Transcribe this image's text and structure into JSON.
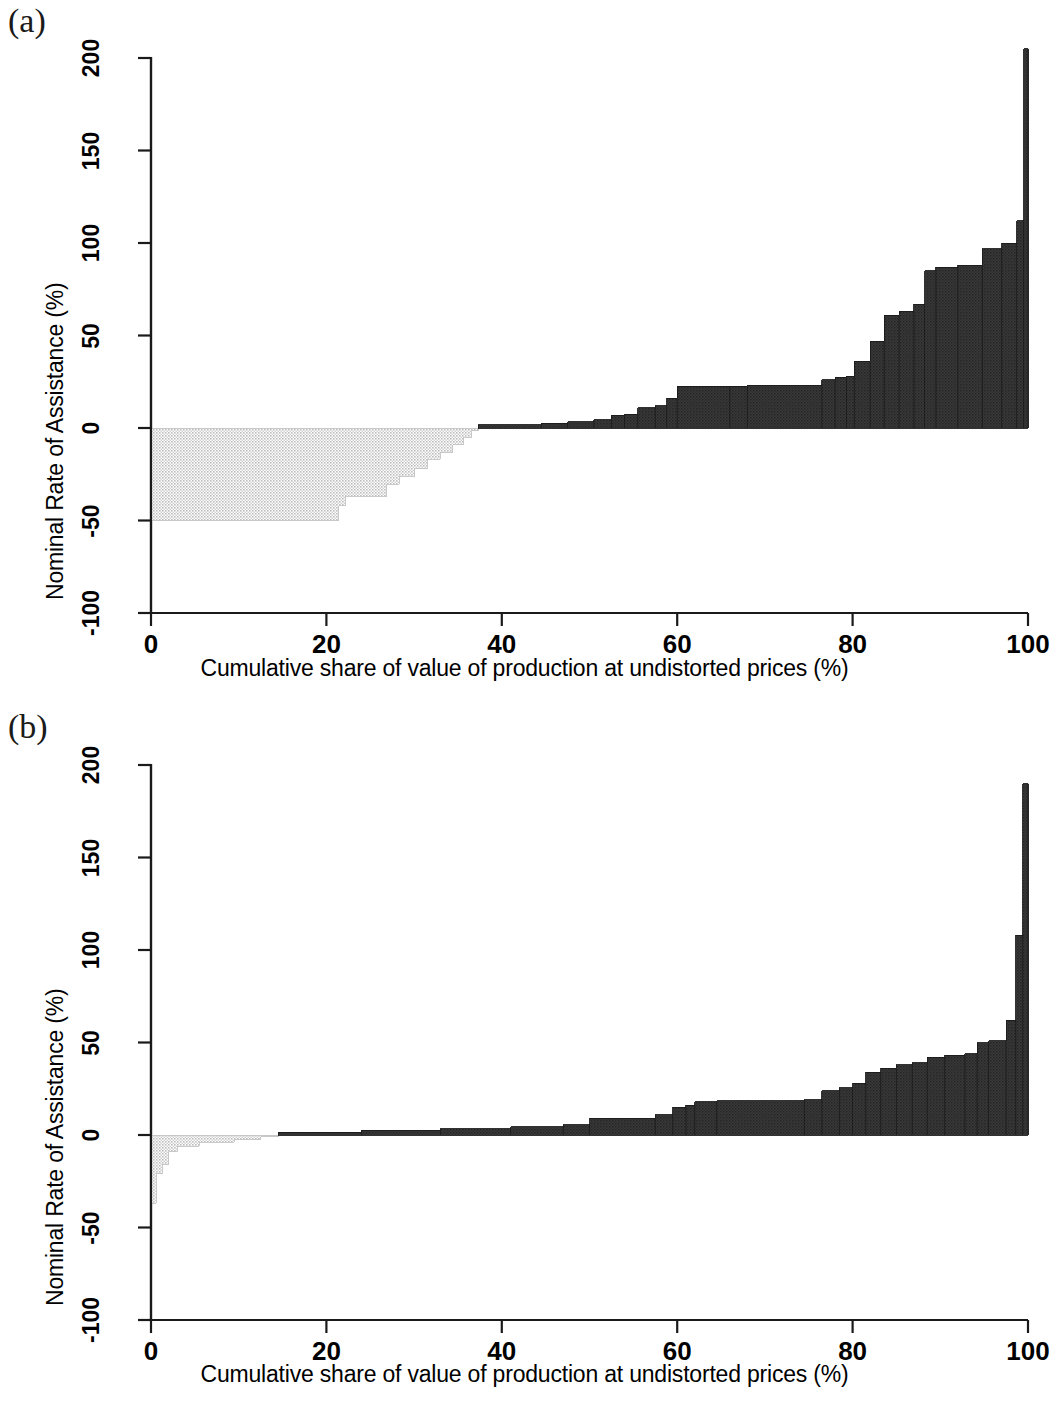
{
  "figure": {
    "background": "#ffffff",
    "panels": [
      {
        "label": "(a)",
        "name": "panel-a"
      },
      {
        "label": "(b)",
        "name": "panel-b"
      }
    ]
  },
  "axis_labels": {
    "y_title": "Nominal Rate of Assistance (%)",
    "x_title": "Cumulative share of value of production at undistorted prices (%)",
    "y_ticks": [
      "-100",
      "-50",
      "0",
      "50",
      "100",
      "150",
      "200"
    ],
    "x_ticks": [
      "0",
      "20",
      "40",
      "60",
      "80",
      "100"
    ]
  },
  "colors": {
    "negative_fill": "#d5d5d5",
    "positive_fill": "#333333",
    "outline": "#111111",
    "axis": "#1a1a1a"
  },
  "chart_data": [
    {
      "type": "area",
      "name": "panel-a",
      "title": "(a)",
      "xlabel": "Cumulative share of value of production at undistorted prices (%)",
      "ylabel": "Nominal Rate of Assistance (%)",
      "xlim": [
        0,
        100
      ],
      "ylim": [
        -100,
        200
      ],
      "yticks": [
        -100,
        -50,
        0,
        50,
        100,
        150,
        200
      ],
      "xticks": [
        0,
        20,
        40,
        60,
        80,
        100
      ],
      "grid": false,
      "legend": "none",
      "description": "Step/ staircase cumulative distribution of Nominal Rate of Assistance against cumulative share of value of production. Negative portion shaded light grey, positive portion shaded dark grey.",
      "steps": [
        {
          "x_start": 0.0,
          "x_end": 21.4,
          "value": -50.0
        },
        {
          "x_start": 21.4,
          "x_end": 22.2,
          "value": -42.0
        },
        {
          "x_start": 22.2,
          "x_end": 26.9,
          "value": -37.0
        },
        {
          "x_start": 26.9,
          "x_end": 28.3,
          "value": -30.5
        },
        {
          "x_start": 28.3,
          "x_end": 30.1,
          "value": -26.0
        },
        {
          "x_start": 30.1,
          "x_end": 31.5,
          "value": -22.0
        },
        {
          "x_start": 31.5,
          "x_end": 33.0,
          "value": -17.0
        },
        {
          "x_start": 33.0,
          "x_end": 34.4,
          "value": -13.0
        },
        {
          "x_start": 34.4,
          "x_end": 35.6,
          "value": -9.0
        },
        {
          "x_start": 35.6,
          "x_end": 36.6,
          "value": -5.0
        },
        {
          "x_start": 36.6,
          "x_end": 37.3,
          "value": -1.5
        },
        {
          "x_start": 37.3,
          "x_end": 44.5,
          "value": 1.8
        },
        {
          "x_start": 44.5,
          "x_end": 47.5,
          "value": 2.5
        },
        {
          "x_start": 47.5,
          "x_end": 50.5,
          "value": 3.5
        },
        {
          "x_start": 50.5,
          "x_end": 52.5,
          "value": 4.5
        },
        {
          "x_start": 52.5,
          "x_end": 54.0,
          "value": 7.0
        },
        {
          "x_start": 54.0,
          "x_end": 55.5,
          "value": 7.5
        },
        {
          "x_start": 55.5,
          "x_end": 57.5,
          "value": 11.0
        },
        {
          "x_start": 57.5,
          "x_end": 58.8,
          "value": 12.0
        },
        {
          "x_start": 58.8,
          "x_end": 60.0,
          "value": 16.0
        },
        {
          "x_start": 60.0,
          "x_end": 66.0,
          "value": 22.5
        },
        {
          "x_start": 66.0,
          "x_end": 68.0,
          "value": 22.5
        },
        {
          "x_start": 68.0,
          "x_end": 76.5,
          "value": 23.0
        },
        {
          "x_start": 76.5,
          "x_end": 78.0,
          "value": 26.0
        },
        {
          "x_start": 78.0,
          "x_end": 79.3,
          "value": 27.5
        },
        {
          "x_start": 79.3,
          "x_end": 80.2,
          "value": 28.0
        },
        {
          "x_start": 80.2,
          "x_end": 82.0,
          "value": 36.0
        },
        {
          "x_start": 82.0,
          "x_end": 83.6,
          "value": 47.0
        },
        {
          "x_start": 83.6,
          "x_end": 85.3,
          "value": 61.0
        },
        {
          "x_start": 85.3,
          "x_end": 87.0,
          "value": 63.0
        },
        {
          "x_start": 87.0,
          "x_end": 88.2,
          "value": 67.0
        },
        {
          "x_start": 88.2,
          "x_end": 89.5,
          "value": 85.0
        },
        {
          "x_start": 89.5,
          "x_end": 92.0,
          "value": 87.0
        },
        {
          "x_start": 92.0,
          "x_end": 94.8,
          "value": 88.0
        },
        {
          "x_start": 94.8,
          "x_end": 97.0,
          "value": 97.0
        },
        {
          "x_start": 97.0,
          "x_end": 98.7,
          "value": 100.0
        },
        {
          "x_start": 98.7,
          "x_end": 99.5,
          "value": 112.0
        },
        {
          "x_start": 99.5,
          "x_end": 100.0,
          "value": 205.0
        }
      ]
    },
    {
      "type": "area",
      "name": "panel-b",
      "title": "(b)",
      "xlabel": "Cumulative share of value of production at undistorted prices (%)",
      "ylabel": "Nominal Rate of Assistance (%)",
      "xlim": [
        0,
        100
      ],
      "ylim": [
        -100,
        200
      ],
      "yticks": [
        -100,
        -50,
        0,
        50,
        100,
        150,
        200
      ],
      "xticks": [
        0,
        20,
        40,
        60,
        80,
        100
      ],
      "grid": false,
      "legend": "none",
      "description": "Step/ staircase cumulative distribution of Nominal Rate of Assistance against cumulative share of value of production. Much smaller negative region than panel (a).",
      "steps": [
        {
          "x_start": 0.0,
          "x_end": 0.6,
          "value": -37.0
        },
        {
          "x_start": 0.6,
          "x_end": 1.3,
          "value": -21.0
        },
        {
          "x_start": 1.3,
          "x_end": 2.0,
          "value": -16.0
        },
        {
          "x_start": 2.0,
          "x_end": 3.0,
          "value": -9.0
        },
        {
          "x_start": 3.0,
          "x_end": 5.5,
          "value": -6.0
        },
        {
          "x_start": 5.5,
          "x_end": 9.5,
          "value": -4.0
        },
        {
          "x_start": 9.5,
          "x_end": 12.5,
          "value": -2.5
        },
        {
          "x_start": 12.5,
          "x_end": 14.5,
          "value": -1.0
        },
        {
          "x_start": 14.5,
          "x_end": 24.0,
          "value": 1.5
        },
        {
          "x_start": 24.0,
          "x_end": 33.0,
          "value": 2.5
        },
        {
          "x_start": 33.0,
          "x_end": 41.0,
          "value": 3.5
        },
        {
          "x_start": 41.0,
          "x_end": 47.0,
          "value": 4.5
        },
        {
          "x_start": 47.0,
          "x_end": 50.0,
          "value": 5.5
        },
        {
          "x_start": 50.0,
          "x_end": 57.5,
          "value": 9.0
        },
        {
          "x_start": 57.5,
          "x_end": 59.5,
          "value": 11.0
        },
        {
          "x_start": 59.5,
          "x_end": 61.0,
          "value": 15.0
        },
        {
          "x_start": 61.0,
          "x_end": 62.0,
          "value": 16.0
        },
        {
          "x_start": 62.0,
          "x_end": 64.5,
          "value": 18.0
        },
        {
          "x_start": 64.5,
          "x_end": 74.5,
          "value": 18.5
        },
        {
          "x_start": 74.5,
          "x_end": 76.5,
          "value": 19.0
        },
        {
          "x_start": 76.5,
          "x_end": 78.5,
          "value": 24.0
        },
        {
          "x_start": 78.5,
          "x_end": 80.0,
          "value": 25.5
        },
        {
          "x_start": 80.0,
          "x_end": 81.5,
          "value": 28.0
        },
        {
          "x_start": 81.5,
          "x_end": 83.2,
          "value": 34.0
        },
        {
          "x_start": 83.2,
          "x_end": 85.0,
          "value": 36.0
        },
        {
          "x_start": 85.0,
          "x_end": 86.8,
          "value": 38.0
        },
        {
          "x_start": 86.8,
          "x_end": 88.5,
          "value": 39.0
        },
        {
          "x_start": 88.5,
          "x_end": 90.5,
          "value": 42.0
        },
        {
          "x_start": 90.5,
          "x_end": 92.8,
          "value": 43.0
        },
        {
          "x_start": 92.8,
          "x_end": 94.2,
          "value": 44.0
        },
        {
          "x_start": 94.2,
          "x_end": 95.5,
          "value": 50.0
        },
        {
          "x_start": 95.5,
          "x_end": 97.5,
          "value": 51.0
        },
        {
          "x_start": 97.5,
          "x_end": 98.6,
          "value": 62.0
        },
        {
          "x_start": 98.6,
          "x_end": 99.4,
          "value": 108.0
        },
        {
          "x_start": 99.4,
          "x_end": 100.0,
          "value": 190.0
        }
      ]
    }
  ]
}
